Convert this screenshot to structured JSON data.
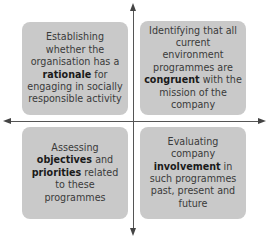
{
  "quadrants": {
    "top_left": {
      "pre": "Establishing whether the organisation has a ",
      "bold": "rationale",
      "post": " for engaging in socially responsible activity"
    },
    "top_right": {
      "pre": "Identifying that all current environment programmes are ",
      "bold": "congruent",
      "post": " with the mission of the company"
    },
    "bottom_left": {
      "pre": "Assessing ",
      "bold": "objectives",
      "mid": " and ",
      "bold2": "priorities",
      "post": " related to these programmes"
    },
    "bottom_right": {
      "pre": "Evaluating company ",
      "bold": "involvement",
      "post": " in such programmes past, present and future"
    }
  },
  "colors": {
    "box": "#c9c9c9",
    "axis": "#555555",
    "text": "#3a3a3a"
  }
}
